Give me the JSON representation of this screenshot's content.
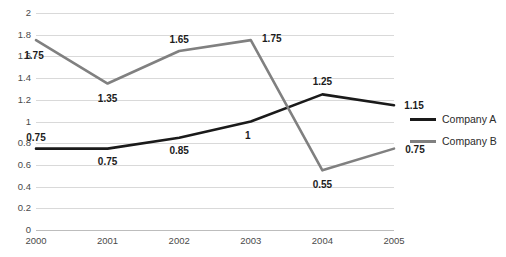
{
  "chart_data": {
    "type": "line",
    "title": "",
    "xlabel": "",
    "ylabel": "",
    "categories": [
      "2000",
      "2001",
      "2002",
      "2003",
      "2004",
      "2005"
    ],
    "ylim": [
      0,
      2
    ],
    "y_ticks": [
      "0",
      "0.2",
      "0.4",
      "0.6",
      "0.8",
      "1",
      "1.2",
      "1.4",
      "1.6",
      "1.8",
      "2"
    ],
    "y_tick_values": [
      0,
      0.2,
      0.4,
      0.6,
      0.8,
      1,
      1.2,
      1.4,
      1.6,
      1.8,
      2
    ],
    "grid": true,
    "legend_position": "right",
    "series": [
      {
        "name": "Company A",
        "color": "#1a1a1a",
        "values": [
          0.75,
          0.75,
          0.85,
          1,
          1.25,
          1.15
        ],
        "labels": [
          "0.75",
          "0.75",
          "0.85",
          "1",
          "1.25",
          "1.15"
        ],
        "label_offsets": [
          {
            "dx": 0,
            "dy": -11
          },
          {
            "dx": 0,
            "dy": 13
          },
          {
            "dx": 0,
            "dy": 13
          },
          {
            "dx": -3,
            "dy": 14
          },
          {
            "dx": 0,
            "dy": -12
          },
          {
            "dx": 20,
            "dy": 1
          }
        ]
      },
      {
        "name": "Company B",
        "color": "#808080",
        "values": [
          1.75,
          1.35,
          1.65,
          1.75,
          0.55,
          0.75
        ],
        "labels": [
          "1.75",
          "1.35",
          "1.65",
          "1.75",
          "0.55",
          "0.75"
        ],
        "label_offsets": [
          {
            "dx": -2,
            "dy": 16
          },
          {
            "dx": 0,
            "dy": 15
          },
          {
            "dx": 0,
            "dy": -11
          },
          {
            "dx": 21,
            "dy": -1
          },
          {
            "dx": 0,
            "dy": 15
          },
          {
            "dx": 21,
            "dy": 1
          }
        ]
      }
    ]
  },
  "legend": {
    "items": [
      {
        "label": "Company A",
        "color": "#1a1a1a"
      },
      {
        "label": "Company B",
        "color": "#808080"
      }
    ]
  }
}
